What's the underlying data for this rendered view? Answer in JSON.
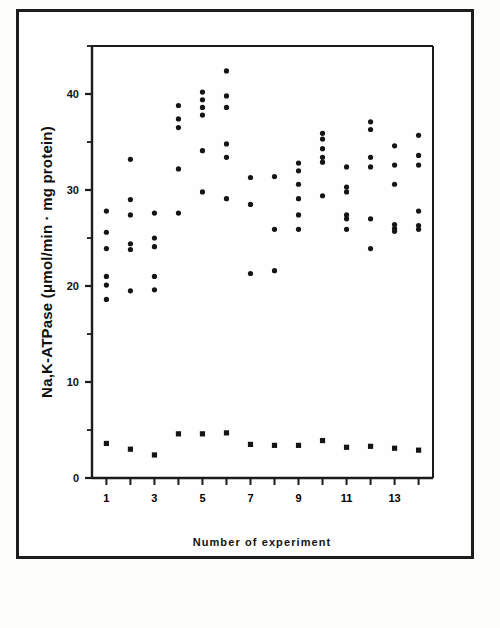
{
  "figure": {
    "kind": "scatter-plot",
    "background_color": "#fefefe",
    "ink_color": "#151515",
    "border_color": "#1c1c1c"
  },
  "chart_data": {
    "type": "scatter",
    "title": "",
    "subtitle": "",
    "xlabel": "Number of experiment",
    "ylabel": "Na,K-ATPase (μmol/min · mg protein)",
    "ylabel_parts": {
      "enzyme": "Na,K−ATPase",
      "units": "(μmol/min · mg protein)"
    },
    "xlim": [
      0.4,
      14.6
    ],
    "ylim": [
      0,
      45
    ],
    "xtick_values": [
      1,
      2,
      3,
      4,
      5,
      6,
      7,
      8,
      9,
      10,
      11,
      12,
      13,
      14
    ],
    "xtick_labels": [
      "1",
      "",
      "3",
      "",
      "5",
      "",
      "7",
      "",
      "9",
      "",
      "11",
      "",
      "13",
      ""
    ],
    "ytick_values": [
      0,
      5,
      10,
      15,
      20,
      25,
      30,
      35,
      40,
      45
    ],
    "ytick_labels": [
      "0",
      "",
      "10",
      "",
      "20",
      "",
      "30",
      "",
      "40",
      ""
    ],
    "grid": false,
    "legend": false,
    "legend_position": "none",
    "axis_style": "left-and-bottom-spine-with-top-right-frame",
    "series": [
      {
        "name": "Na,K-ATPase activity",
        "marker": "circle",
        "color": "#151515",
        "points": [
          {
            "x": 1,
            "y": 27.8
          },
          {
            "x": 1,
            "y": 25.6
          },
          {
            "x": 1,
            "y": 23.9
          },
          {
            "x": 1,
            "y": 21.0
          },
          {
            "x": 1,
            "y": 20.1
          },
          {
            "x": 1,
            "y": 18.6
          },
          {
            "x": 2,
            "y": 33.2
          },
          {
            "x": 2,
            "y": 29.0
          },
          {
            "x": 2,
            "y": 27.4
          },
          {
            "x": 2,
            "y": 24.4
          },
          {
            "x": 2,
            "y": 23.8
          },
          {
            "x": 2,
            "y": 19.5
          },
          {
            "x": 3,
            "y": 27.6
          },
          {
            "x": 3,
            "y": 25.0
          },
          {
            "x": 3,
            "y": 24.1
          },
          {
            "x": 3,
            "y": 21.0
          },
          {
            "x": 3,
            "y": 19.6
          },
          {
            "x": 4,
            "y": 38.8
          },
          {
            "x": 4,
            "y": 37.4
          },
          {
            "x": 4,
            "y": 36.5
          },
          {
            "x": 4,
            "y": 32.2
          },
          {
            "x": 4,
            "y": 27.6
          },
          {
            "x": 5,
            "y": 40.2
          },
          {
            "x": 5,
            "y": 39.4
          },
          {
            "x": 5,
            "y": 38.6
          },
          {
            "x": 5,
            "y": 37.8
          },
          {
            "x": 5,
            "y": 34.1
          },
          {
            "x": 5,
            "y": 29.8
          },
          {
            "x": 6,
            "y": 42.4
          },
          {
            "x": 6,
            "y": 39.8
          },
          {
            "x": 6,
            "y": 38.6
          },
          {
            "x": 6,
            "y": 34.8
          },
          {
            "x": 6,
            "y": 33.4
          },
          {
            "x": 6,
            "y": 29.1
          },
          {
            "x": 7,
            "y": 31.3
          },
          {
            "x": 7,
            "y": 28.5
          },
          {
            "x": 7,
            "y": 21.3
          },
          {
            "x": 8,
            "y": 31.4
          },
          {
            "x": 8,
            "y": 25.9
          },
          {
            "x": 8,
            "y": 21.6
          },
          {
            "x": 9,
            "y": 32.8
          },
          {
            "x": 9,
            "y": 32.0
          },
          {
            "x": 9,
            "y": 30.6
          },
          {
            "x": 9,
            "y": 29.1
          },
          {
            "x": 9,
            "y": 27.4
          },
          {
            "x": 9,
            "y": 25.9
          },
          {
            "x": 10,
            "y": 35.9
          },
          {
            "x": 10,
            "y": 35.3
          },
          {
            "x": 10,
            "y": 34.3
          },
          {
            "x": 10,
            "y": 33.4
          },
          {
            "x": 10,
            "y": 32.9
          },
          {
            "x": 10,
            "y": 29.4
          },
          {
            "x": 11,
            "y": 32.4
          },
          {
            "x": 11,
            "y": 30.3
          },
          {
            "x": 11,
            "y": 29.8
          },
          {
            "x": 11,
            "y": 27.4
          },
          {
            "x": 11,
            "y": 27.0
          },
          {
            "x": 11,
            "y": 25.9
          },
          {
            "x": 12,
            "y": 37.1
          },
          {
            "x": 12,
            "y": 36.3
          },
          {
            "x": 12,
            "y": 33.4
          },
          {
            "x": 12,
            "y": 32.4
          },
          {
            "x": 12,
            "y": 27.0
          },
          {
            "x": 12,
            "y": 23.9
          },
          {
            "x": 13,
            "y": 34.6
          },
          {
            "x": 13,
            "y": 32.6
          },
          {
            "x": 13,
            "y": 30.6
          },
          {
            "x": 13,
            "y": 26.4
          },
          {
            "x": 13,
            "y": 26.0
          },
          {
            "x": 13,
            "y": 25.7
          },
          {
            "x": 14,
            "y": 35.7
          },
          {
            "x": 14,
            "y": 33.6
          },
          {
            "x": 14,
            "y": 32.6
          },
          {
            "x": 14,
            "y": 27.8
          },
          {
            "x": 14,
            "y": 26.3
          },
          {
            "x": 14,
            "y": 25.9
          }
        ]
      },
      {
        "name": "Ouabain-insensitive activity",
        "marker": "square",
        "color": "#151515",
        "points": [
          {
            "x": 1,
            "y": 3.6
          },
          {
            "x": 2,
            "y": 3.0
          },
          {
            "x": 3,
            "y": 2.4
          },
          {
            "x": 4,
            "y": 4.6
          },
          {
            "x": 5,
            "y": 4.6
          },
          {
            "x": 6,
            "y": 4.7
          },
          {
            "x": 7,
            "y": 3.5
          },
          {
            "x": 8,
            "y": 3.4
          },
          {
            "x": 9,
            "y": 3.4
          },
          {
            "x": 10,
            "y": 3.9
          },
          {
            "x": 11,
            "y": 3.2
          },
          {
            "x": 12,
            "y": 3.3
          },
          {
            "x": 13,
            "y": 3.1
          },
          {
            "x": 14,
            "y": 2.9
          }
        ]
      }
    ]
  }
}
